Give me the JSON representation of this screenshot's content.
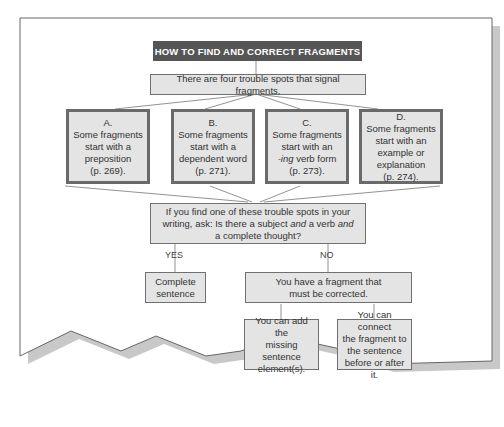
{
  "diagram": {
    "title": "HOW TO FIND AND CORRECT FRAGMENTS",
    "intro": "There are four trouble spots that signal fragments.",
    "spots": [
      {
        "letter": "A.",
        "l1": "Some fragments",
        "l2": "start with a",
        "l3": "preposition",
        "l4": "(p. 269)."
      },
      {
        "letter": "B.",
        "l1": "Some fragments",
        "l2": "start with a",
        "l3": "dependent word",
        "l4": "(p. 271)."
      },
      {
        "letter": "C.",
        "l1": "Some fragments",
        "l2": "start with an",
        "l3_italic": "-ing",
        "l3": " verb form",
        "l4": "(p. 273)."
      },
      {
        "letter": "D.",
        "l1": "Some fragments",
        "l2": "start with an",
        "l3": "example or",
        "l4": "explanation",
        "l5": "(p. 274)."
      }
    ],
    "question": {
      "l1": "If you find one of these trouble spots in your",
      "l2a": "writing, ask: Is there a subject ",
      "l2b": "and",
      "l2c": " a verb ",
      "l2d": "and",
      "l3": "a complete thought?"
    },
    "yes_label": "YES",
    "no_label": "NO",
    "complete": {
      "l1": "Complete",
      "l2": "sentence"
    },
    "fragment": {
      "l1": "You have a fragment that",
      "l2": "must be corrected."
    },
    "fix_add": {
      "l1": "You can add the",
      "l2": "missing sentence",
      "l3": "element(s)."
    },
    "fix_connect": {
      "l1": "You can connect",
      "l2": "the fragment to",
      "l3": "the sentence",
      "l4": "before or after it."
    }
  }
}
